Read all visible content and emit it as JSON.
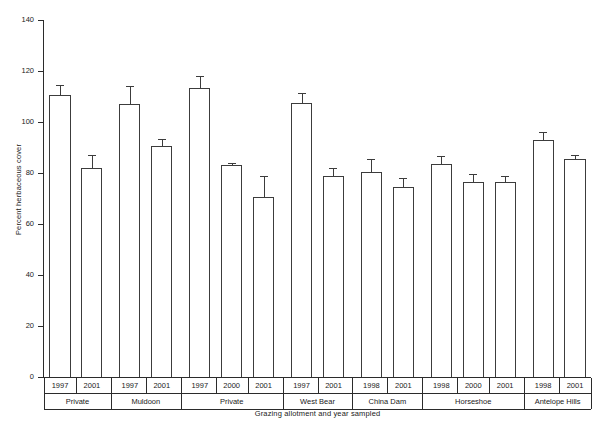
{
  "chart_data": {
    "type": "bar",
    "title": "",
    "xlabel": "Grazing allotment and year sampled",
    "ylabel": "Percent herbaceous cover",
    "ylim": [
      0,
      140
    ],
    "ytick_labels": [
      "0",
      "20",
      "40",
      "60",
      "80",
      "100",
      "120",
      "140"
    ],
    "ytick_values": [
      0,
      20,
      40,
      60,
      80,
      100,
      120,
      140
    ],
    "grid": false,
    "legend": null,
    "categories": [
      "Private 1997",
      "Private 2001",
      "Muldoon 1997",
      "Muldoon 2001",
      "Private 1997",
      "Private 2000",
      "Private 2001",
      "West Bear 1997",
      "West Bear 2001",
      "China Dam 1998",
      "China Dam 2001",
      "Horseshoe 1998",
      "Horseshoe 2000",
      "Horseshoe 2001",
      "Antelope Hills 1998",
      "Antelope Hills 2001"
    ],
    "values": [
      110.5,
      82.0,
      107.0,
      90.5,
      113.5,
      83.0,
      70.5,
      107.5,
      79.0,
      80.5,
      74.5,
      83.5,
      76.5,
      76.5,
      93.0,
      85.5
    ],
    "errors": [
      4.0,
      5.0,
      7.0,
      3.0,
      4.5,
      0.8,
      8.5,
      4.0,
      3.0,
      5.0,
      3.5,
      3.0,
      3.0,
      2.5,
      3.0,
      1.5
    ],
    "groups": [
      {
        "name": "Private",
        "years": [
          "1997",
          "2001"
        ]
      },
      {
        "name": "Muldoon",
        "years": [
          "1997",
          "2001"
        ]
      },
      {
        "name": "Private",
        "years": [
          "1997",
          "2000",
          "2001"
        ]
      },
      {
        "name": "West Bear",
        "years": [
          "1997",
          "2001"
        ]
      },
      {
        "name": "China Dam",
        "years": [
          "1998",
          "2001"
        ]
      },
      {
        "name": "Horseshoe",
        "years": [
          "1998",
          "2000",
          "2001"
        ]
      },
      {
        "name": "Antelope Hills",
        "years": [
          "1998",
          "2001"
        ]
      }
    ]
  },
  "style": {
    "bar_fill": "#ffffff",
    "bar_stroke": "#3c3c3c",
    "axis_color": "#2b2b2b",
    "text_color": "#1a1a1a",
    "background": "#ffffff"
  }
}
